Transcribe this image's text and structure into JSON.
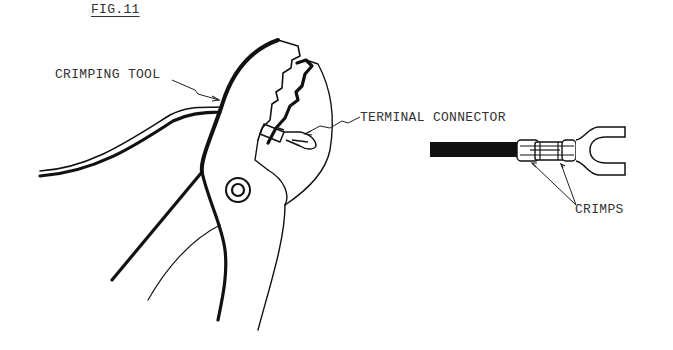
{
  "figure": {
    "title": "FIG.11",
    "labels": {
      "crimping_tool": "CRIMPING TOOL",
      "terminal_connector": "TERMINAL CONNECTOR",
      "crimps": "CRIMPS"
    },
    "colors": {
      "ink": "#111111",
      "text": "#333333",
      "background": "#ffffff"
    }
  }
}
